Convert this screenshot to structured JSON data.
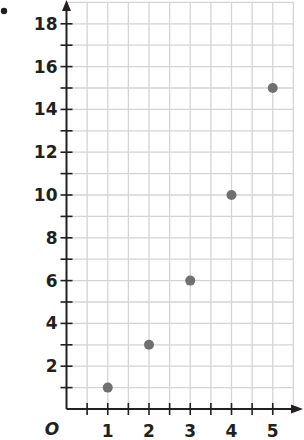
{
  "chart_data": {
    "type": "scatter",
    "title": "",
    "xlabel": "",
    "ylabel": "",
    "origin_label": "O",
    "x": [
      1,
      2,
      3,
      4,
      5
    ],
    "y": [
      1,
      3,
      6,
      10,
      15
    ],
    "series": [
      {
        "name": "points",
        "x": [
          1,
          2,
          3,
          4,
          5
        ],
        "y": [
          1,
          3,
          6,
          10,
          15
        ]
      }
    ],
    "xlim": [
      0,
      5.5
    ],
    "ylim": [
      0,
      19
    ],
    "x_ticks": [
      1,
      2,
      3,
      4,
      5
    ],
    "y_ticks": [
      2,
      4,
      6,
      8,
      10,
      12,
      14,
      16,
      18
    ],
    "x_minor_step": 0.5,
    "y_minor_step": 1,
    "grid": true,
    "legend": null,
    "colors": {
      "point": "#707070",
      "axis": "#231f20",
      "grid": "#d4d4d4",
      "text": "#231f20"
    }
  }
}
